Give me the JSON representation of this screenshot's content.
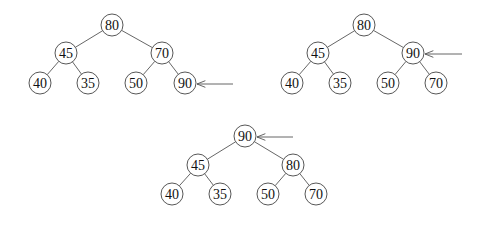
{
  "node_radius": 11,
  "colors": {
    "edge": "#555555",
    "node_stroke": "#444444",
    "text": "#111111",
    "background": "#ffffff"
  },
  "trees": [
    {
      "id": "step-1",
      "caption": "90 inserted as last leaf",
      "nodes": [
        {
          "id": "a0",
          "value": "80",
          "x": 112,
          "y": 25
        },
        {
          "id": "a1",
          "value": "45",
          "x": 66,
          "y": 53
        },
        {
          "id": "a2",
          "value": "70",
          "x": 162,
          "y": 53
        },
        {
          "id": "a3",
          "value": "40",
          "x": 40,
          "y": 83
        },
        {
          "id": "a4",
          "value": "35",
          "x": 88,
          "y": 83
        },
        {
          "id": "a5",
          "value": "50",
          "x": 136,
          "y": 83
        },
        {
          "id": "a6",
          "value": "90",
          "x": 185,
          "y": 83
        }
      ],
      "edges": [
        [
          "a0",
          "a1"
        ],
        [
          "a0",
          "a2"
        ],
        [
          "a1",
          "a3"
        ],
        [
          "a1",
          "a4"
        ],
        [
          "a2",
          "a5"
        ],
        [
          "a2",
          "a6"
        ]
      ],
      "arrow": {
        "from": [
          233,
          84
        ],
        "to": [
          197,
          84
        ],
        "target": "a6"
      }
    },
    {
      "id": "step-2",
      "caption": "90 swapped with parent 70",
      "nodes": [
        {
          "id": "b0",
          "value": "80",
          "x": 364,
          "y": 25
        },
        {
          "id": "b1",
          "value": "45",
          "x": 318,
          "y": 53
        },
        {
          "id": "b2",
          "value": "90",
          "x": 413,
          "y": 53
        },
        {
          "id": "b3",
          "value": "40",
          "x": 292,
          "y": 83
        },
        {
          "id": "b4",
          "value": "35",
          "x": 340,
          "y": 83
        },
        {
          "id": "b5",
          "value": "50",
          "x": 388,
          "y": 83
        },
        {
          "id": "b6",
          "value": "70",
          "x": 436,
          "y": 83
        }
      ],
      "edges": [
        [
          "b0",
          "b1"
        ],
        [
          "b0",
          "b2"
        ],
        [
          "b1",
          "b3"
        ],
        [
          "b1",
          "b4"
        ],
        [
          "b2",
          "b5"
        ],
        [
          "b2",
          "b6"
        ]
      ],
      "arrow": {
        "from": [
          462,
          54
        ],
        "to": [
          425,
          54
        ],
        "target": "b2"
      }
    },
    {
      "id": "step-3",
      "caption": "90 swapped with root 80",
      "nodes": [
        {
          "id": "c0",
          "value": "90",
          "x": 245,
          "y": 136
        },
        {
          "id": "c1",
          "value": "45",
          "x": 198,
          "y": 165
        },
        {
          "id": "c2",
          "value": "80",
          "x": 293,
          "y": 165
        },
        {
          "id": "c3",
          "value": "40",
          "x": 172,
          "y": 194
        },
        {
          "id": "c4",
          "value": "35",
          "x": 220,
          "y": 194
        },
        {
          "id": "c5",
          "value": "50",
          "x": 268,
          "y": 194
        },
        {
          "id": "c6",
          "value": "70",
          "x": 316,
          "y": 194
        }
      ],
      "edges": [
        [
          "c0",
          "c1"
        ],
        [
          "c0",
          "c2"
        ],
        [
          "c1",
          "c3"
        ],
        [
          "c1",
          "c4"
        ],
        [
          "c2",
          "c5"
        ],
        [
          "c2",
          "c6"
        ]
      ],
      "arrow": {
        "from": [
          293,
          137
        ],
        "to": [
          257,
          137
        ],
        "target": "c0"
      }
    }
  ]
}
